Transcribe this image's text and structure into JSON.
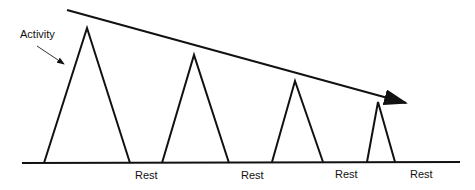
{
  "diagram": {
    "activity_label": "Activity",
    "rest_labels": [
      "Rest",
      "Rest",
      "Rest",
      "Rest"
    ],
    "peaks": [
      {
        "base_left": 44,
        "apex_x": 87,
        "apex_y": 28,
        "base_right": 130
      },
      {
        "base_left": 162,
        "apex_x": 194,
        "apex_y": 55,
        "base_right": 229
      },
      {
        "base_left": 272,
        "apex_x": 295,
        "apex_y": 81,
        "base_right": 323
      },
      {
        "base_left": 367,
        "apex_x": 378,
        "apex_y": 102,
        "base_right": 395
      }
    ],
    "trend": "decreasing activity peaks over time",
    "line_color": "#111111"
  }
}
